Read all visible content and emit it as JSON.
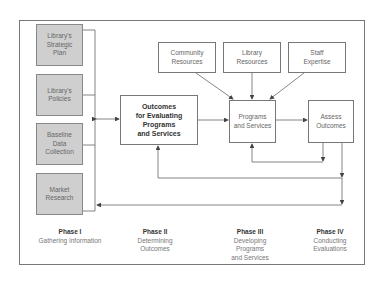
{
  "diagram": {
    "phase1_inputs": [
      {
        "id": "strategic-plan",
        "label": "Library's\nStrategic\nPlan"
      },
      {
        "id": "policies",
        "label": "Library's\nPolicies"
      },
      {
        "id": "baseline",
        "label": "Baseline\nData\nCollection"
      },
      {
        "id": "market",
        "label": "Market\nResearch"
      }
    ],
    "outcomes": {
      "label": "Outcomes\nfor Evaluating\nPrograms\nand Services"
    },
    "resources": [
      {
        "id": "community",
        "label": "Community\nResources"
      },
      {
        "id": "library",
        "label": "Library\nResources"
      },
      {
        "id": "staff",
        "label": "Staff\nExpertise"
      }
    ],
    "programs": {
      "label": "Programs\nand Services"
    },
    "assess": {
      "label": "Assess\nOutcomes"
    },
    "phases": [
      {
        "title": "Phase I",
        "desc": "Gathering Information"
      },
      {
        "title": "Phase II",
        "desc": "Determining\nOutcomes"
      },
      {
        "title": "Phase III",
        "desc": "Developing\nPrograms\nand Services"
      },
      {
        "title": "Phase IV",
        "desc": "Conducting\nEvaluations"
      }
    ],
    "colors": {
      "input_fill": "#cfcfcf",
      "line": "#555555",
      "frame": "#777777"
    }
  }
}
